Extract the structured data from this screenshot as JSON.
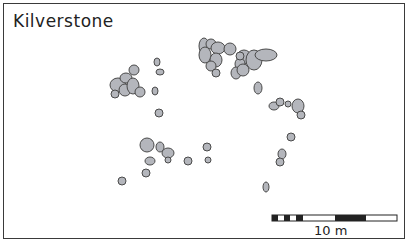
{
  "title": "Kilverstone",
  "scale_bar": {
    "label": "10 m"
  },
  "colors": {
    "pit_fill": "#b4b6bc",
    "pit_stroke": "#4a4a4a",
    "frame": "#3a3a3a"
  },
  "pits": [
    [
      204,
      46,
      5,
      8
    ],
    [
      211,
      44,
      5,
      5
    ],
    [
      218,
      48,
      7,
      6
    ],
    [
      230,
      49,
      6,
      6
    ],
    [
      205,
      55,
      6,
      8
    ],
    [
      216,
      60,
      6,
      7
    ],
    [
      211,
      66,
      5,
      5
    ],
    [
      244,
      57,
      7,
      7
    ],
    [
      254,
      60,
      8,
      10
    ],
    [
      266,
      55,
      11,
      6
    ],
    [
      240,
      64,
      5,
      6
    ],
    [
      236,
      73,
      5,
      6
    ],
    [
      243,
      70,
      6,
      6
    ],
    [
      240,
      56,
      4,
      4
    ],
    [
      216,
      73,
      4,
      4
    ],
    [
      258,
      88,
      4,
      6
    ],
    [
      118,
      85,
      8,
      7
    ],
    [
      126,
      78,
      6,
      5
    ],
    [
      134,
      70,
      5,
      5
    ],
    [
      125,
      90,
      6,
      6
    ],
    [
      133,
      86,
      6,
      8
    ],
    [
      115,
      94,
      4,
      4
    ],
    [
      140,
      92,
      5,
      5
    ],
    [
      157,
      62,
      3,
      4
    ],
    [
      160,
      72,
      4,
      3
    ],
    [
      155,
      91,
      3,
      4
    ],
    [
      159,
      113,
      4,
      4
    ],
    [
      274,
      106,
      5,
      4
    ],
    [
      280,
      102,
      4,
      4
    ],
    [
      288,
      104,
      3,
      3
    ],
    [
      298,
      106,
      6,
      7
    ],
    [
      301,
      115,
      4,
      4
    ],
    [
      291,
      137,
      4,
      4
    ],
    [
      282,
      154,
      4,
      5
    ],
    [
      280,
      162,
      4,
      4
    ],
    [
      266,
      187,
      3,
      5
    ],
    [
      147,
      145,
      7,
      7
    ],
    [
      160,
      147,
      4,
      5
    ],
    [
      168,
      153,
      6,
      5
    ],
    [
      150,
      161,
      5,
      4
    ],
    [
      168,
      160,
      3,
      3
    ],
    [
      146,
      173,
      4,
      4
    ],
    [
      122,
      181,
      4,
      4
    ],
    [
      188,
      161,
      4,
      4
    ],
    [
      207,
      147,
      4,
      4
    ],
    [
      208,
      160,
      3,
      3
    ]
  ]
}
